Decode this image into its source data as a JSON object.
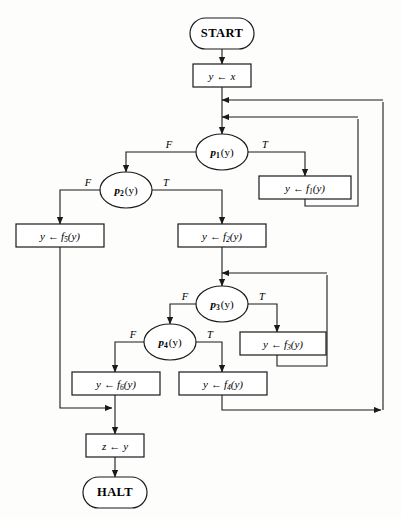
{
  "diagram": {
    "background_color": "#fdfdfc",
    "line_color": "#1a1a1a",
    "nodes": {
      "start": {
        "label": "START",
        "shape": "terminal"
      },
      "init": {
        "label_var": "y",
        "arrow": "←",
        "label_val": "x",
        "shape": "process"
      },
      "p1": {
        "name": "p",
        "sub": "1",
        "arg": "(y)",
        "shape": "decision"
      },
      "p2": {
        "name": "p",
        "sub": "2",
        "arg": "(y)",
        "shape": "decision"
      },
      "p3": {
        "name": "p",
        "sub": "3",
        "arg": "(y)",
        "shape": "decision"
      },
      "p4": {
        "name": "p",
        "sub": "4",
        "arg": "(y)",
        "shape": "decision"
      },
      "f1": {
        "lhs": "y",
        "arrow": "←",
        "fn": "f",
        "sub": "1",
        "arg": "(y)",
        "shape": "process"
      },
      "f2": {
        "lhs": "y",
        "arrow": "←",
        "fn": "f",
        "sub": "2",
        "arg": "(y)",
        "shape": "process"
      },
      "f3": {
        "lhs": "y",
        "arrow": "←",
        "fn": "f",
        "sub": "3",
        "arg": "(y)",
        "shape": "process"
      },
      "f4": {
        "lhs": "y",
        "arrow": "←",
        "fn": "f",
        "sub": "4",
        "arg": "(y)",
        "shape": "process"
      },
      "f5": {
        "lhs": "y",
        "arrow": "←",
        "fn": "f",
        "sub": "5",
        "arg": "(y)",
        "shape": "process"
      },
      "f6": {
        "lhs": "y",
        "arrow": "←",
        "fn": "f",
        "sub": "6",
        "arg": "(y)",
        "shape": "process"
      },
      "assign_z": {
        "lhs": "z",
        "arrow": "←",
        "rhs": "y",
        "shape": "process"
      },
      "halt": {
        "label": "HALT",
        "shape": "terminal"
      }
    },
    "branch_labels": {
      "p1_false": "F",
      "p1_true": "T",
      "p2_false": "F",
      "p2_true": "T",
      "p3_false": "F",
      "p3_true": "T",
      "p4_false": "F",
      "p4_true": "T"
    }
  }
}
